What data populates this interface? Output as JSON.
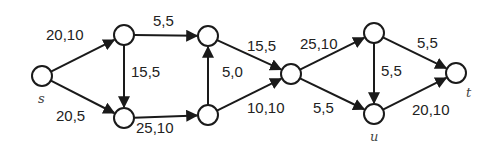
{
  "diagram": {
    "type": "flow-network",
    "colors": {
      "stroke": "#1a1a1a",
      "text": "#222222",
      "node_fill": "#ffffff",
      "background": "#ffffff"
    },
    "nodes": [
      {
        "id": "s",
        "label": "s",
        "x": 42,
        "y": 76,
        "lx": 38,
        "ly": 103
      },
      {
        "id": "a",
        "label": "",
        "x": 124,
        "y": 35
      },
      {
        "id": "b",
        "label": "",
        "x": 124,
        "y": 118
      },
      {
        "id": "c",
        "label": "",
        "x": 208,
        "y": 36
      },
      {
        "id": "d",
        "label": "",
        "x": 208,
        "y": 115
      },
      {
        "id": "e",
        "label": "",
        "x": 291,
        "y": 74
      },
      {
        "id": "f",
        "label": "",
        "x": 374,
        "y": 33
      },
      {
        "id": "u",
        "label": "u",
        "x": 374,
        "y": 114,
        "lx": 370,
        "ly": 141
      },
      {
        "id": "t",
        "label": "t",
        "x": 456,
        "y": 73,
        "lx": 466,
        "ly": 97
      }
    ],
    "edges": [
      {
        "from": "s",
        "to": "a",
        "label": "20,10",
        "lx": 46,
        "ly": 40
      },
      {
        "from": "s",
        "to": "b",
        "label": "20,5",
        "lx": 56,
        "ly": 121
      },
      {
        "from": "a",
        "to": "c",
        "label": "5,5",
        "lx": 153,
        "ly": 26
      },
      {
        "from": "a",
        "to": "b",
        "label": "15,5",
        "lx": 131,
        "ly": 77
      },
      {
        "from": "b",
        "to": "d",
        "label": "25,10",
        "lx": 136,
        "ly": 133
      },
      {
        "from": "d",
        "to": "c",
        "label": "5,0",
        "lx": 222,
        "ly": 77
      },
      {
        "from": "c",
        "to": "e",
        "label": "15,5",
        "lx": 247,
        "ly": 51
      },
      {
        "from": "d",
        "to": "e",
        "label": "10,10",
        "lx": 247,
        "ly": 113
      },
      {
        "from": "e",
        "to": "f",
        "label": "25,10",
        "lx": 300,
        "ly": 49
      },
      {
        "from": "e",
        "to": "u",
        "label": "5,5",
        "lx": 313,
        "ly": 113
      },
      {
        "from": "f",
        "to": "u",
        "label": "5,5",
        "lx": 381,
        "ly": 76
      },
      {
        "from": "f",
        "to": "t",
        "label": "5,5",
        "lx": 417,
        "ly": 48
      },
      {
        "from": "u",
        "to": "t",
        "label": "20,10",
        "lx": 412,
        "ly": 115
      }
    ]
  }
}
